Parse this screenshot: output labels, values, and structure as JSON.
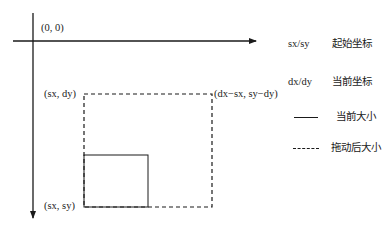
{
  "diagram": {
    "origin_label": "(0, 0)",
    "points": {
      "top_left": "(sx, dy)",
      "top_right": "(dx−sx, sy−dy)",
      "bottom_left": "(sx, sy)"
    }
  },
  "legend": {
    "items": [
      {
        "key": "sx/sy",
        "desc": "起始坐标"
      },
      {
        "key": "dx/dy",
        "desc": "当前坐标"
      },
      {
        "key": "solid-line",
        "desc": "当前大小"
      },
      {
        "key": "dashed-line",
        "desc": "拖动后大小"
      }
    ]
  },
  "colors": {
    "stroke": "#1a1a1a",
    "background": "#ffffff"
  }
}
